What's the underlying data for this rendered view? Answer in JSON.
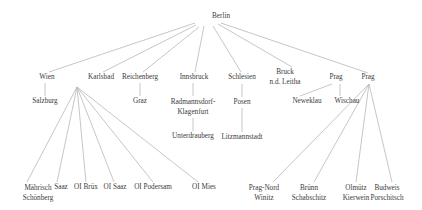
{
  "diagram": {
    "type": "tree",
    "root": {
      "id": "berlin",
      "label": [
        "Berlin"
      ],
      "x": 221,
      "y": 17
    },
    "nodes": [
      {
        "id": "wien",
        "label": [
          "Wien"
        ],
        "x": 47,
        "y": 78
      },
      {
        "id": "karlsbad",
        "label": [
          "Karlsbad"
        ],
        "x": 101,
        "y": 78
      },
      {
        "id": "reichenberg",
        "label": [
          "Reichenberg"
        ],
        "x": 140,
        "y": 78
      },
      {
        "id": "innsbruck",
        "label": [
          "Innsbruck"
        ],
        "x": 194,
        "y": 78
      },
      {
        "id": "schlesien",
        "label": [
          "Schlesien"
        ],
        "x": 242,
        "y": 78
      },
      {
        "id": "bruck",
        "label": [
          "Bruck",
          "n.d. Leitha"
        ],
        "x": 285,
        "y": 77
      },
      {
        "id": "prag1",
        "label": [
          "Prag"
        ],
        "x": 336,
        "y": 78
      },
      {
        "id": "prag2",
        "label": [
          "Prag"
        ],
        "x": 368,
        "y": 78
      },
      {
        "id": "salzburg",
        "label": [
          "Salzburg"
        ],
        "x": 45,
        "y": 102
      },
      {
        "id": "graz",
        "label": [
          "Graz"
        ],
        "x": 140,
        "y": 102
      },
      {
        "id": "radmannsdorf",
        "label": [
          "Radmannsdorf-",
          "Klagenfurt"
        ],
        "x": 193,
        "y": 107
      },
      {
        "id": "posen",
        "label": [
          "Posen"
        ],
        "x": 242,
        "y": 103
      },
      {
        "id": "neweklau",
        "label": [
          "Neweklau"
        ],
        "x": 307,
        "y": 102
      },
      {
        "id": "wischau",
        "label": [
          "Wischau"
        ],
        "x": 347,
        "y": 102
      },
      {
        "id": "unterdrauberg",
        "label": [
          "Unterdrauberg"
        ],
        "x": 193,
        "y": 137
      },
      {
        "id": "litzmannstadt",
        "label": [
          "Litzmannstadt"
        ],
        "x": 242,
        "y": 138
      },
      {
        "id": "maehrisch",
        "label": [
          "Mährisch",
          "Schönberg"
        ],
        "x": 38,
        "y": 193
      },
      {
        "id": "saaz",
        "label": [
          "Saaz"
        ],
        "x": 61,
        "y": 188
      },
      {
        "id": "oi-bruex",
        "label": [
          "OI Brüx"
        ],
        "x": 86,
        "y": 188
      },
      {
        "id": "oi-saaz",
        "label": [
          "OI Saaz"
        ],
        "x": 115,
        "y": 188
      },
      {
        "id": "oi-podersam",
        "label": [
          "OI Podersam"
        ],
        "x": 153,
        "y": 188
      },
      {
        "id": "oi-mies",
        "label": [
          "OI Mies"
        ],
        "x": 204,
        "y": 188
      },
      {
        "id": "prag-nord",
        "label": [
          "Prag-Nord",
          "Winitz"
        ],
        "x": 264,
        "y": 193
      },
      {
        "id": "bruenn",
        "label": [
          "Brünn",
          "Schabschitz"
        ],
        "x": 309,
        "y": 193
      },
      {
        "id": "olmuetz",
        "label": [
          "Olmütz",
          "Kierwein"
        ],
        "x": 356,
        "y": 193
      },
      {
        "id": "budweis",
        "label": [
          "Budweis",
          "Porschitsch"
        ],
        "x": 387,
        "y": 193
      }
    ],
    "edges": [
      {
        "from": "berlin",
        "to": "wien",
        "x1": 195,
        "y1": 23,
        "x2": 49,
        "y2": 72
      },
      {
        "from": "berlin",
        "to": "karlsbad",
        "x1": 196,
        "y1": 25,
        "x2": 103,
        "y2": 72
      },
      {
        "from": "berlin",
        "to": "reichenberg",
        "x1": 199,
        "y1": 27,
        "x2": 143,
        "y2": 72
      },
      {
        "from": "berlin",
        "to": "innsbruck",
        "x1": 204,
        "y1": 26,
        "x2": 195,
        "y2": 72
      },
      {
        "from": "berlin",
        "to": "schlesien",
        "x1": 213,
        "y1": 26,
        "x2": 241,
        "y2": 72
      },
      {
        "from": "berlin",
        "to": "bruck",
        "x1": 218,
        "y1": 24,
        "x2": 292,
        "y2": 67
      },
      {
        "from": "berlin",
        "to": "prag2",
        "x1": 221,
        "y1": 23,
        "x2": 368,
        "y2": 73
      },
      {
        "from": "wien",
        "to": "salzburg",
        "x1": 45,
        "y1": 83,
        "x2": 45,
        "y2": 96
      },
      {
        "from": "reichenberg",
        "to": "graz",
        "x1": 140,
        "y1": 83,
        "x2": 140,
        "y2": 96
      },
      {
        "from": "innsbruck",
        "to": "radmannsdorf",
        "x1": 193,
        "y1": 83,
        "x2": 193,
        "y2": 96
      },
      {
        "from": "radmannsdorf",
        "to": "unterdrauberg",
        "x1": 193,
        "y1": 118,
        "x2": 193,
        "y2": 131
      },
      {
        "from": "schlesien",
        "to": "posen",
        "x1": 242,
        "y1": 84,
        "x2": 242,
        "y2": 97
      },
      {
        "from": "posen",
        "to": "litzmannstadt",
        "x1": 242,
        "y1": 108,
        "x2": 242,
        "y2": 132
      },
      {
        "from": "prag1",
        "to": "neweklau",
        "x1": 332,
        "y1": 84,
        "x2": 300,
        "y2": 96
      },
      {
        "from": "prag1",
        "to": "wischau",
        "x1": 340,
        "y1": 84,
        "x2": 340,
        "y2": 96
      },
      {
        "from": "karlsbad",
        "to": "maehrisch",
        "x1": 77,
        "y1": 87,
        "x2": 27,
        "y2": 182
      },
      {
        "from": "karlsbad",
        "to": "saaz",
        "x1": 77,
        "y1": 87,
        "x2": 57,
        "y2": 182
      },
      {
        "from": "karlsbad",
        "to": "oi-bruex",
        "x1": 77,
        "y1": 87,
        "x2": 86,
        "y2": 182
      },
      {
        "from": "karlsbad",
        "to": "oi-saaz",
        "x1": 77,
        "y1": 87,
        "x2": 114,
        "y2": 182
      },
      {
        "from": "karlsbad",
        "to": "oi-podersam",
        "x1": 77,
        "y1": 87,
        "x2": 153,
        "y2": 182
      },
      {
        "from": "karlsbad",
        "to": "oi-mies",
        "x1": 77,
        "y1": 87,
        "x2": 198,
        "y2": 182
      },
      {
        "from": "prag2",
        "to": "prag-nord",
        "x1": 369,
        "y1": 84,
        "x2": 273,
        "y2": 182
      },
      {
        "from": "prag2",
        "to": "bruenn",
        "x1": 369,
        "y1": 84,
        "x2": 314,
        "y2": 182
      },
      {
        "from": "prag2",
        "to": "olmuetz",
        "x1": 369,
        "y1": 84,
        "x2": 356,
        "y2": 182
      },
      {
        "from": "prag2",
        "to": "budweis",
        "x1": 369,
        "y1": 84,
        "x2": 392,
        "y2": 182
      }
    ],
    "colors": {
      "edge": "#b8b8b8",
      "text": "#3a3a3a",
      "background": "#ffffff"
    }
  }
}
